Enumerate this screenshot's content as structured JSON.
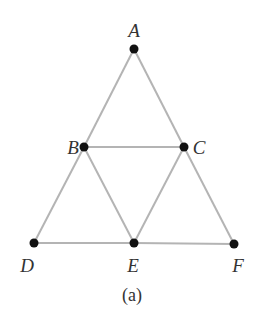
{
  "figure": {
    "caption": "(a)",
    "colors": {
      "edge": "#b4b4b4",
      "vertex": "#111111",
      "label": "#333333",
      "background": "#ffffff"
    },
    "vertices": [
      {
        "id": "A",
        "label": "A",
        "x": 134,
        "y": 49
      },
      {
        "id": "B",
        "label": "B",
        "x": 84,
        "y": 147
      },
      {
        "id": "C",
        "label": "C",
        "x": 184,
        "y": 147
      },
      {
        "id": "D",
        "label": "D",
        "x": 34,
        "y": 243
      },
      {
        "id": "E",
        "label": "E",
        "x": 134,
        "y": 243
      },
      {
        "id": "F",
        "label": "F",
        "x": 234,
        "y": 244
      }
    ],
    "edges": [
      [
        "A",
        "B"
      ],
      [
        "A",
        "C"
      ],
      [
        "B",
        "C"
      ],
      [
        "B",
        "D"
      ],
      [
        "B",
        "E"
      ],
      [
        "C",
        "E"
      ],
      [
        "C",
        "F"
      ],
      [
        "D",
        "E"
      ],
      [
        "E",
        "F"
      ]
    ]
  }
}
